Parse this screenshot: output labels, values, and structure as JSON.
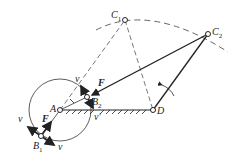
{
  "diagram": {
    "type": "four-bar linkage (crank-rocker) with limit positions",
    "points": {
      "A": {
        "label": "A",
        "x": 60,
        "y": 110
      },
      "D": {
        "label": "D",
        "x": 153,
        "y": 110
      },
      "C1": {
        "label": "C",
        "sub": "1",
        "x": 125,
        "y": 20
      },
      "C2": {
        "label": "C",
        "sub": "2",
        "x": 208,
        "y": 34
      },
      "B1": {
        "label": "B",
        "sub": "1",
        "x": 41,
        "y": 136
      },
      "B2": {
        "label": "B",
        "sub": "2",
        "x": 87,
        "y": 97
      }
    },
    "labels": {
      "force": "F",
      "velocity": "v",
      "velocity_prime": "v′"
    },
    "colors": {
      "line": "#222222",
      "dashed": "#555555",
      "background": "#ffffff"
    }
  }
}
